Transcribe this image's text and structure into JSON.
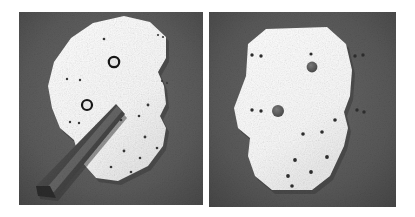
{
  "figure": {
    "background_color": "#ffffff",
    "panel_count": 2
  },
  "colors": {
    "page_background": "#ffffff",
    "panel_background": "#5c5c5c",
    "panel_background_dark": "#4a4a4a",
    "workpiece_fill": "#fbfbfb",
    "workpiece_shadow": "#d8d8d8",
    "mark_dark": "#2a2a2a",
    "ring_stroke": "#181818",
    "large_hole_fill": "#5a5a5a",
    "tool_body": "#4b4b4b",
    "tool_highlight": "#7a7a7a",
    "tool_dark": "#323232"
  },
  "panels": [
    {
      "id": "left-panel",
      "name": "left-photo-panel",
      "caption": "",
      "rect": {
        "x": 19,
        "y": 12,
        "width": 184,
        "height": 193
      },
      "workpiece": {
        "name": "polygonal-workpiece-left",
        "polygon_points": "71,38 93,23 124,16 150,22 166,37 166,58 158,72 164,86 166,104 160,116 166,128 163,146 148,166 118,181 96,178 80,160 74,140 60,128 52,108 48,86 54,62",
        "fill": "#fbfbfb"
      },
      "ring_marks": [
        {
          "name": "ring-mark-upper",
          "cx": 114,
          "cy": 62,
          "r": 5.2,
          "stroke_width": 2.2
        },
        {
          "name": "ring-mark-lower",
          "cx": 87,
          "cy": 105,
          "r": 5.0,
          "stroke_width": 2.2
        }
      ],
      "punch_marks": [
        {
          "cx": 104,
          "cy": 39,
          "r": 1.3
        },
        {
          "cx": 158,
          "cy": 35,
          "r": 1.1
        },
        {
          "cx": 163,
          "cy": 37,
          "r": 1.1
        },
        {
          "cx": 67,
          "cy": 79,
          "r": 1.2
        },
        {
          "cx": 80,
          "cy": 80,
          "r": 1.2
        },
        {
          "cx": 162,
          "cy": 81,
          "r": 1.1
        },
        {
          "cx": 167,
          "cy": 83,
          "r": 1.1
        },
        {
          "cx": 70,
          "cy": 122,
          "r": 1.2
        },
        {
          "cx": 79,
          "cy": 123,
          "r": 1.2
        },
        {
          "cx": 148,
          "cy": 105,
          "r": 1.4
        },
        {
          "cx": 139,
          "cy": 116,
          "r": 1.3
        },
        {
          "cx": 121,
          "cy": 120,
          "r": 1.3
        },
        {
          "cx": 145,
          "cy": 137,
          "r": 1.4
        },
        {
          "cx": 124,
          "cy": 151,
          "r": 1.4
        },
        {
          "cx": 140,
          "cy": 158,
          "r": 1.3
        },
        {
          "cx": 157,
          "cy": 148,
          "r": 1.3
        },
        {
          "cx": 111,
          "cy": 167,
          "r": 1.3
        },
        {
          "cx": 131,
          "cy": 172,
          "r": 1.3
        }
      ],
      "tool": {
        "name": "center-punch-tool",
        "label": "center punch / scriber",
        "tip": {
          "x": 118,
          "y": 106
        },
        "handle_end": {
          "x": 42,
          "y": 192
        },
        "body_points": "116,104 125,114 56,198 38,196 36,186",
        "highlight_points": "117,106 122,111 54,192 44,191"
      }
    },
    {
      "id": "right-panel",
      "name": "right-photo-panel",
      "caption": "",
      "rect": {
        "x": 209,
        "y": 12,
        "width": 187,
        "height": 195
      },
      "workpiece": {
        "name": "polygonal-workpiece-right",
        "polygon_points": "248,44 266,29 327,27 346,44 352,70 350,96 344,112 348,128 344,146 330,176 312,190 272,190 255,176 248,156 250,138 238,128 234,108 240,92 246,76",
        "fill": "#fbfbfb"
      },
      "large_holes": [
        {
          "name": "large-hole-upper",
          "cx": 312,
          "cy": 67,
          "r": 5.4
        },
        {
          "name": "large-hole-lower",
          "cx": 278,
          "cy": 111,
          "r": 6.0
        }
      ],
      "punch_marks": [
        {
          "cx": 311,
          "cy": 54,
          "r": 1.6
        },
        {
          "cx": 252,
          "cy": 55,
          "r": 1.7
        },
        {
          "cx": 261,
          "cy": 56,
          "r": 1.7
        },
        {
          "cx": 355,
          "cy": 56,
          "r": 1.7
        },
        {
          "cx": 363,
          "cy": 55,
          "r": 1.7
        },
        {
          "cx": 252,
          "cy": 110,
          "r": 1.7
        },
        {
          "cx": 261,
          "cy": 111,
          "r": 1.7
        },
        {
          "cx": 357,
          "cy": 110,
          "r": 1.7
        },
        {
          "cx": 364,
          "cy": 112,
          "r": 1.7
        },
        {
          "cx": 335,
          "cy": 120,
          "r": 1.8
        },
        {
          "cx": 322,
          "cy": 132,
          "r": 1.8
        },
        {
          "cx": 303,
          "cy": 134,
          "r": 1.8
        },
        {
          "cx": 327,
          "cy": 157,
          "r": 1.9
        },
        {
          "cx": 295,
          "cy": 160,
          "r": 1.9
        },
        {
          "cx": 311,
          "cy": 172,
          "r": 1.9
        },
        {
          "cx": 288,
          "cy": 176,
          "r": 1.9
        },
        {
          "cx": 292,
          "cy": 186,
          "r": 1.8
        }
      ]
    }
  ]
}
